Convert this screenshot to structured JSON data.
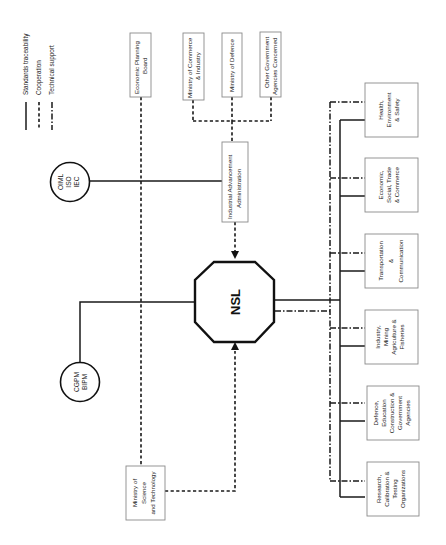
{
  "legend": {
    "items": [
      {
        "label": "Standards traceability",
        "line_style": "solid"
      },
      {
        "label": "Cooperation",
        "line_style": "dashed"
      },
      {
        "label": "Technical support",
        "line_style": "dash-dot"
      }
    ]
  },
  "center": {
    "label": "NSL",
    "shape": "octagon"
  },
  "international_bodies": [
    {
      "lines": [
        "OIML",
        "ISO",
        "IEC"
      ],
      "shape": "circle"
    },
    {
      "lines": [
        "CGPM",
        "BIPM"
      ],
      "shape": "circle"
    }
  ],
  "government_bodies": {
    "economic_planning_board": {
      "lines": [
        "Economic Planning",
        "Board"
      ]
    },
    "ministry_commerce": {
      "lines": [
        "Ministry of Commerce",
        "& Industry"
      ]
    },
    "ministry_defence": {
      "lines": [
        "Ministry of Defence"
      ]
    },
    "other_agencies": {
      "lines": [
        "Other Government",
        "Agencies Concerned"
      ]
    },
    "industrial_advancement": {
      "lines": [
        "Industrial Advancement",
        "Administration"
      ]
    },
    "ministry_science": {
      "lines": [
        "Ministry of",
        "Science",
        "and Technology"
      ]
    }
  },
  "sectors": [
    {
      "lines": [
        "Health,",
        "Environment",
        "& Safety"
      ]
    },
    {
      "lines": [
        "Economic,",
        "Social, Trade",
        "& Commerce"
      ]
    },
    {
      "lines": [
        "Transportation",
        "&",
        "Communication"
      ]
    },
    {
      "lines": [
        "Industry,",
        "Mining",
        "Agriculture &",
        "Fisheries"
      ]
    },
    {
      "lines": [
        "Defence,",
        "Education",
        "Construction &",
        "Government",
        "Agencies"
      ]
    },
    {
      "lines": [
        "Research,",
        "Calibration &",
        "Testing",
        "Organizations"
      ]
    }
  ]
}
